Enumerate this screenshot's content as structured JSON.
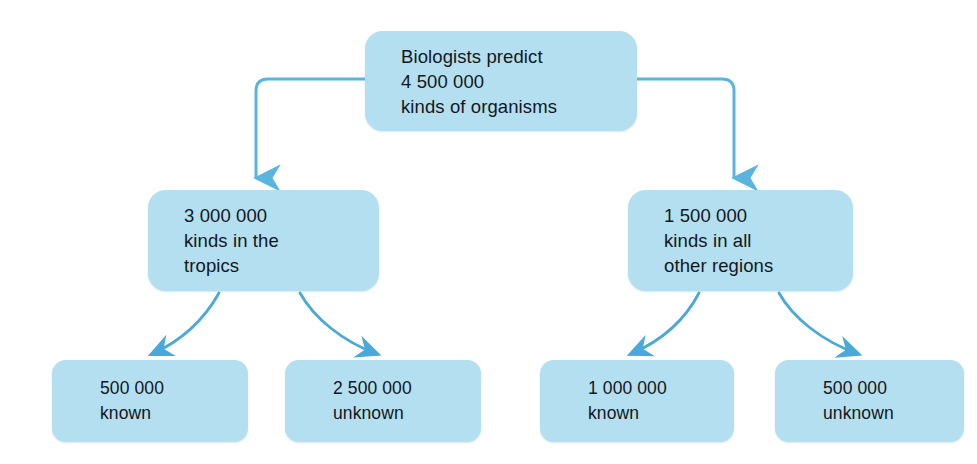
{
  "diagram": {
    "type": "hierarchy-flow-diagram",
    "colors": {
      "box_fill": "#b3dff0",
      "connector": "#5ab4e0",
      "text": "#14171a",
      "background": "#ffffff"
    },
    "nodes": [
      {
        "id": "root",
        "level": 1,
        "lines": [
          "Biologists predict",
          "4 500 000",
          "kinds of organisms"
        ],
        "value": 4500000
      },
      {
        "id": "tropics",
        "level": 2,
        "lines": [
          "3 000 000",
          "kinds in the",
          "tropics"
        ],
        "value": 3000000
      },
      {
        "id": "other-regions",
        "level": 2,
        "lines": [
          "1 500 000",
          "kinds in all",
          "other regions"
        ],
        "value": 1500000
      },
      {
        "id": "tropics-known",
        "level": 3,
        "lines": [
          "500 000",
          "known"
        ],
        "value": 500000
      },
      {
        "id": "tropics-unknown",
        "level": 3,
        "lines": [
          "2 500 000",
          "unknown"
        ],
        "value": 2500000
      },
      {
        "id": "other-known",
        "level": 3,
        "lines": [
          "1 000 000",
          "known"
        ],
        "value": 1000000
      },
      {
        "id": "other-unknown",
        "level": 3,
        "lines": [
          "500 000",
          "unknown"
        ],
        "value": 500000
      }
    ],
    "edges": [
      {
        "from": "root",
        "to": "tropics",
        "style": "elbow-arrow"
      },
      {
        "from": "root",
        "to": "other-regions",
        "style": "elbow-arrow"
      },
      {
        "from": "tropics",
        "to": "tropics-known",
        "style": "curved-arrow"
      },
      {
        "from": "tropics",
        "to": "tropics-unknown",
        "style": "curved-arrow"
      },
      {
        "from": "other-regions",
        "to": "other-known",
        "style": "curved-arrow"
      },
      {
        "from": "other-regions",
        "to": "other-unknown",
        "style": "curved-arrow"
      }
    ]
  }
}
